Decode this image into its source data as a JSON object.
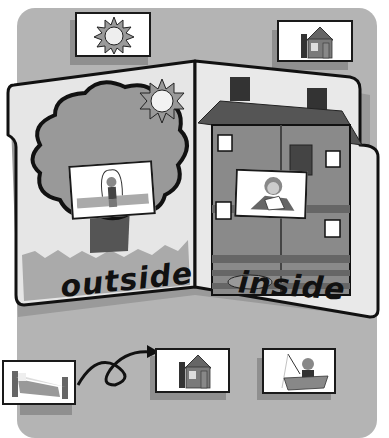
{
  "activity": {
    "title": "outside / inside sorting folder",
    "folder": {
      "left_panel": {
        "label": "outside",
        "scene": "tree-with-sun",
        "card": "jump-rope-child"
      },
      "right_panel": {
        "label": "inside",
        "scene": "house-interior",
        "card": "child-writing"
      }
    },
    "top_cards": [
      {
        "name": "sun",
        "icon": "sun-icon"
      },
      {
        "name": "house",
        "icon": "house-icon"
      }
    ],
    "bottom_cards": [
      {
        "name": "bed",
        "icon": "bed-icon"
      },
      {
        "name": "house",
        "icon": "house-icon"
      },
      {
        "name": "boy-fishing-in-boat",
        "icon": "fishing-boat-icon"
      }
    ],
    "arrow": {
      "from": "bed",
      "to": "house",
      "style": "looped-arrow"
    }
  },
  "colors": {
    "board": "#b4b4b4",
    "folder": "#e6e6e6",
    "outline": "#111111",
    "tree": "#9a9a9a",
    "trunk": "#5a5a5a",
    "roof": "#555555",
    "card": "#ffffff"
  }
}
